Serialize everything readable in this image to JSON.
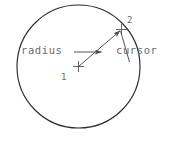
{
  "figure": {
    "kind": "cad-circle-construction-diagram",
    "background_color": "#ffffff",
    "stroke_color": "#2b2b2b",
    "text_color": "#6b6b6b",
    "width": 188,
    "height": 141,
    "labels": {
      "radius": "radius",
      "cursor": "cursor",
      "point_1": "1",
      "point_2": "2"
    },
    "geometry": {
      "circle": {
        "center_x": 78.5,
        "center_y": 66.5,
        "radius": 61.5
      },
      "center_marker": {
        "x": 78.5,
        "y": 66.5,
        "arm": 5.5
      },
      "cursor_marker": {
        "x": 121.5,
        "y": 29.5,
        "arm": 5.5
      },
      "radius_vector": {
        "x1": 78.5,
        "y1": 66.5,
        "x2": 121.5,
        "y2": 29.5
      },
      "radius_leader": {
        "x1": 74.0,
        "y1": 52.0,
        "x2": 103.0,
        "y2": 52.0
      },
      "cursor_leader": {
        "x1": 121.0,
        "y1": 31.0,
        "x2": 129.0,
        "y2": 59.0
      }
    }
  }
}
